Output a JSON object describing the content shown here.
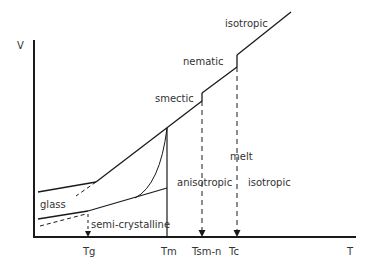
{
  "diagram": {
    "axis": {
      "y_label": "V",
      "x_label": "T"
    },
    "temperature_ticks": [
      {
        "id": "tg",
        "label": "Tg"
      },
      {
        "id": "tm",
        "label": "Tm"
      },
      {
        "id": "tsmn",
        "label": "Tsm-n"
      },
      {
        "id": "tc",
        "label": "Tc"
      }
    ],
    "phase_labels": {
      "glass": "glass",
      "semi_crystalline": "semi-crystalline",
      "smectic": "smectic",
      "nematic": "nematic",
      "isotropic_top": "isotropic",
      "melt": "melt",
      "anisotropic": "anisotropic",
      "isotropic_region": "isotropic"
    },
    "colors": {
      "line": "#1a1a1a",
      "text": "#333333",
      "background": "#ffffff"
    }
  }
}
